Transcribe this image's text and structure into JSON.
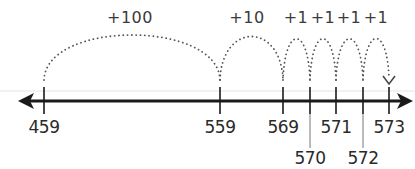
{
  "diagram": {
    "type": "open-number-line",
    "start": 459,
    "end": 573,
    "ticks": [
      {
        "value": "459",
        "x": 44,
        "row": "top"
      },
      {
        "value": "559",
        "x": 220,
        "row": "top"
      },
      {
        "value": "569",
        "x": 283,
        "row": "top"
      },
      {
        "value": "570",
        "x": 310,
        "row": "bottom"
      },
      {
        "value": "571",
        "x": 336,
        "row": "top"
      },
      {
        "value": "572",
        "x": 363,
        "row": "bottom"
      },
      {
        "value": "573",
        "x": 389,
        "row": "top"
      }
    ],
    "jumps": [
      {
        "label": "+100",
        "from": 459,
        "to": 559
      },
      {
        "label": "+10",
        "from": 559,
        "to": 569
      },
      {
        "label": "+1",
        "from": 569,
        "to": 570
      },
      {
        "label": "+1",
        "from": 570,
        "to": 571
      },
      {
        "label": "+1",
        "from": 571,
        "to": 572
      },
      {
        "label": "+1",
        "from": 572,
        "to": 573
      }
    ],
    "colors": {
      "line": "#1a1a1a",
      "dots": "#555555",
      "text": "#2a2a2a"
    }
  }
}
